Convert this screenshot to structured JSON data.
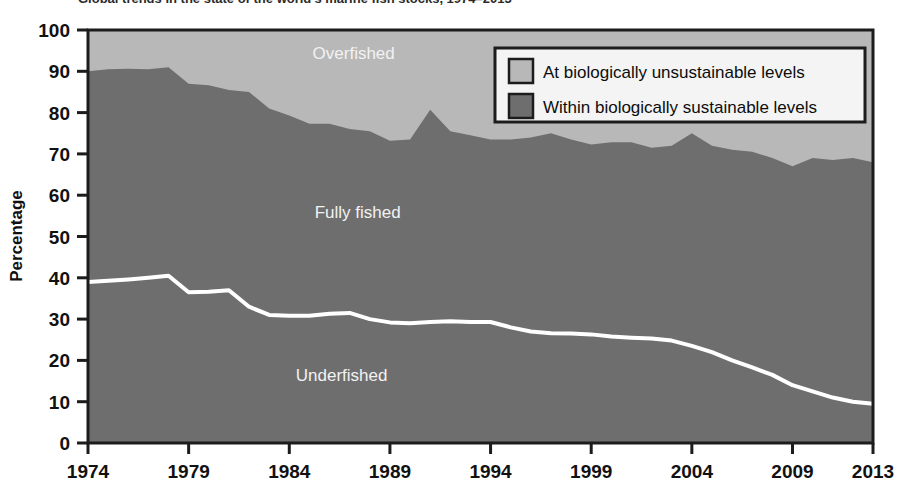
{
  "figure": {
    "title_fragment": "Global trends in the state of the world's marine fish stocks, 1974–2013",
    "percentage_axis_title": "Percentage",
    "background_color": "#ffffff",
    "frame_color": "#1c1c1c"
  },
  "legend": {
    "position": "top-right",
    "box_fill": "#f4f4f4",
    "items": [
      {
        "label": "At biologically unsustainable levels",
        "color": "#b8b8b8"
      },
      {
        "label": "Within biologically sustainable levels",
        "color": "#6e6e6e"
      }
    ]
  },
  "band_labels": [
    {
      "text": "Overfished",
      "x_year": 1987.2,
      "y_value": 93.0,
      "color": "#f2f2f2"
    },
    {
      "text": "Fully fished",
      "x_year": 1987.4,
      "y_value": 54.5,
      "color": "#f2f2f2"
    },
    {
      "text": "Underfished",
      "x_year": 1986.6,
      "y_value": 15.0,
      "color": "#f2f2f2"
    }
  ],
  "chart_data": {
    "type": "area",
    "title": "Global trends in the state of the world's marine fish stocks, 1974–2013",
    "xlabel": "",
    "ylabel": "Percentage",
    "xlim": [
      1974,
      2013
    ],
    "ylim": [
      0,
      100
    ],
    "grid": false,
    "legend_position": "top-right",
    "stacked": true,
    "x": [
      1974,
      1975,
      1976,
      1977,
      1978,
      1979,
      1980,
      1981,
      1982,
      1983,
      1984,
      1985,
      1986,
      1987,
      1988,
      1989,
      1990,
      1991,
      1992,
      1993,
      1994,
      1995,
      1996,
      1997,
      1998,
      1999,
      2000,
      2001,
      2002,
      2003,
      2004,
      2005,
      2006,
      2007,
      2008,
      2009,
      2010,
      2011,
      2012,
      2013
    ],
    "x_tick_labels": [
      "1974",
      "1979",
      "1984",
      "1989",
      "1994",
      "1999",
      "2004",
      "2009",
      "2013"
    ],
    "x_ticks": [
      1974,
      1979,
      1984,
      1989,
      1994,
      1999,
      2004,
      2009,
      2013
    ],
    "y_ticks": [
      0,
      10,
      20,
      30,
      40,
      50,
      60,
      70,
      80,
      90,
      100
    ],
    "y_tick_labels": [
      "0",
      "10",
      "20",
      "30",
      "40",
      "50",
      "60",
      "70",
      "80",
      "90",
      "100"
    ],
    "series": [
      {
        "name": "Underfished",
        "key": "underfished",
        "color": "#6e6e6e",
        "boundary_line_color": "#ffffff",
        "values": [
          39.0,
          39.3,
          39.6,
          40.0,
          40.5,
          36.5,
          36.6,
          37.0,
          33.0,
          31.0,
          30.8,
          30.8,
          31.3,
          31.5,
          30.0,
          29.2,
          29.0,
          29.3,
          29.5,
          29.3,
          29.3,
          28.0,
          27.0,
          26.6,
          26.5,
          26.3,
          25.8,
          25.5,
          25.3,
          24.8,
          23.5,
          22.0,
          20.0,
          18.3,
          16.5,
          14.0,
          12.5,
          11.0,
          10.0,
          9.5
        ]
      },
      {
        "name": "Fully fished",
        "key": "fully_fished",
        "color": "#6e6e6e",
        "values": [
          51.0,
          51.2,
          51.0,
          50.5,
          50.5,
          50.5,
          50.0,
          48.5,
          52.0,
          50.0,
          48.5,
          46.5,
          46.0,
          44.5,
          45.5,
          44.0,
          44.5,
          51.4,
          46.0,
          45.2,
          44.2,
          45.5,
          47.0,
          48.4,
          47.0,
          46.0,
          47.0,
          47.3,
          46.2,
          47.2,
          51.5,
          50.0,
          51.0,
          52.2,
          52.5,
          53.0,
          56.5,
          57.5,
          59.0,
          58.5
        ]
      },
      {
        "name": "At biologically unsustainable levels",
        "key": "overfished",
        "color": "#b8b8b8",
        "values": [
          10.0,
          9.5,
          9.4,
          9.5,
          9.0,
          13.0,
          13.4,
          14.5,
          15.0,
          19.0,
          20.7,
          22.7,
          22.7,
          24.0,
          24.5,
          26.8,
          26.5,
          19.3,
          24.5,
          25.5,
          26.5,
          26.5,
          26.0,
          25.0,
          26.5,
          27.7,
          27.2,
          27.2,
          28.5,
          28.0,
          25.0,
          28.0,
          29.0,
          29.5,
          31.0,
          33.0,
          31.0,
          31.5,
          31.0,
          32.0
        ]
      }
    ],
    "sustainable_top_boundary": {
      "name": "Top of within-biologically-sustainable band",
      "values": [
        90.0,
        90.5,
        90.6,
        90.5,
        91.0,
        87.0,
        86.6,
        85.5,
        85.0,
        81.0,
        79.3,
        77.3,
        77.3,
        76.0,
        75.5,
        73.2,
        73.5,
        80.7,
        75.5,
        74.5,
        73.5,
        73.5,
        74.0,
        75.0,
        73.5,
        72.3,
        72.8,
        72.8,
        71.5,
        72.0,
        75.0,
        72.0,
        71.0,
        70.5,
        69.0,
        67.0,
        69.0,
        68.5,
        69.0,
        68.0
      ]
    }
  }
}
